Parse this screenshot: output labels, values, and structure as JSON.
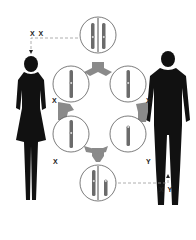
{
  "diagram": {
    "type": "sex-determination",
    "labels": {
      "female_genotype": "X X",
      "male_genotype": "X Y",
      "left_gamete": "X",
      "right_gamete": "X",
      "bottom_left_gamete": "X",
      "bottom_right_gamete": "Y"
    },
    "nodes": [
      {
        "id": "top",
        "content": "XX chromosome pair"
      },
      {
        "id": "upper-left",
        "content": "X chromosome"
      },
      {
        "id": "upper-right",
        "content": "X chromosome"
      },
      {
        "id": "lower-left",
        "content": "X chromosome"
      },
      {
        "id": "lower-right",
        "content": "Y chromosome"
      },
      {
        "id": "bottom",
        "content": "XY chromosome pair"
      }
    ],
    "figures": [
      {
        "id": "female",
        "label": "X X"
      },
      {
        "id": "male",
        "label": "X Y"
      }
    ],
    "colors": {
      "silhouette": "#111111",
      "chromosome": "#6b6b6b",
      "connector": "#8a8a8a",
      "circle": "#444444"
    }
  }
}
